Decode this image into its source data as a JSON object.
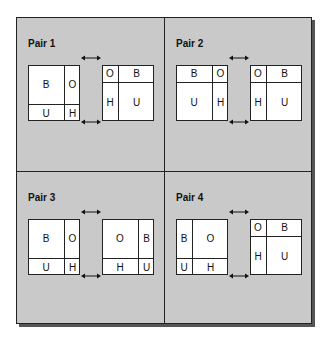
{
  "pairs": [
    {
      "label": "Pair 1",
      "left": {
        "layout": "tall-left-wide-top",
        "cells": [
          {
            "text": "B",
            "x": 0,
            "y": 0,
            "w": 36,
            "h": 39
          },
          {
            "text": "O",
            "x": 36,
            "y": 0,
            "w": 16,
            "h": 39
          },
          {
            "text": "U",
            "x": 0,
            "y": 39,
            "w": 36,
            "h": 17
          },
          {
            "text": "H",
            "x": 36,
            "y": 39,
            "w": 16,
            "h": 17
          }
        ]
      },
      "right": {
        "cells": [
          {
            "text": "O",
            "x": 0,
            "y": 0,
            "w": 16,
            "h": 17
          },
          {
            "text": "B",
            "x": 16,
            "y": 0,
            "w": 36,
            "h": 17
          },
          {
            "text": "H",
            "x": 0,
            "y": 17,
            "w": 16,
            "h": 39
          },
          {
            "text": "U",
            "x": 16,
            "y": 17,
            "w": 36,
            "h": 39
          }
        ]
      }
    },
    {
      "label": "Pair 2",
      "left": {
        "cells": [
          {
            "text": "B",
            "x": 0,
            "y": 0,
            "w": 36,
            "h": 17
          },
          {
            "text": "O",
            "x": 36,
            "y": 0,
            "w": 16,
            "h": 17
          },
          {
            "text": "U",
            "x": 0,
            "y": 17,
            "w": 36,
            "h": 39
          },
          {
            "text": "H",
            "x": 36,
            "y": 17,
            "w": 16,
            "h": 39
          }
        ]
      },
      "right": {
        "cells": [
          {
            "text": "O",
            "x": 0,
            "y": 0,
            "w": 16,
            "h": 17
          },
          {
            "text": "B",
            "x": 16,
            "y": 0,
            "w": 36,
            "h": 17
          },
          {
            "text": "H",
            "x": 0,
            "y": 17,
            "w": 16,
            "h": 39
          },
          {
            "text": "U",
            "x": 16,
            "y": 17,
            "w": 36,
            "h": 39
          }
        ]
      }
    },
    {
      "label": "Pair 3",
      "left": {
        "cells": [
          {
            "text": "B",
            "x": 0,
            "y": 0,
            "w": 36,
            "h": 39
          },
          {
            "text": "O",
            "x": 36,
            "y": 0,
            "w": 16,
            "h": 39
          },
          {
            "text": "U",
            "x": 0,
            "y": 39,
            "w": 36,
            "h": 17
          },
          {
            "text": "H",
            "x": 36,
            "y": 39,
            "w": 16,
            "h": 17
          }
        ]
      },
      "right": {
        "cells": [
          {
            "text": "O",
            "x": 0,
            "y": 0,
            "w": 36,
            "h": 39
          },
          {
            "text": "B",
            "x": 36,
            "y": 0,
            "w": 16,
            "h": 39
          },
          {
            "text": "H",
            "x": 0,
            "y": 39,
            "w": 36,
            "h": 17
          },
          {
            "text": "U",
            "x": 36,
            "y": 39,
            "w": 16,
            "h": 17
          }
        ]
      }
    },
    {
      "label": "Pair 4",
      "left": {
        "cells": [
          {
            "text": "B",
            "x": 0,
            "y": 0,
            "w": 16,
            "h": 39
          },
          {
            "text": "O",
            "x": 16,
            "y": 0,
            "w": 36,
            "h": 39
          },
          {
            "text": "U",
            "x": 0,
            "y": 39,
            "w": 16,
            "h": 17
          },
          {
            "text": "H",
            "x": 16,
            "y": 39,
            "w": 36,
            "h": 17
          }
        ]
      },
      "right": {
        "cells": [
          {
            "text": "O",
            "x": 0,
            "y": 0,
            "w": 16,
            "h": 17
          },
          {
            "text": "B",
            "x": 16,
            "y": 0,
            "w": 36,
            "h": 17
          },
          {
            "text": "H",
            "x": 0,
            "y": 17,
            "w": 16,
            "h": 39
          },
          {
            "text": "U",
            "x": 16,
            "y": 17,
            "w": 36,
            "h": 39
          }
        ]
      }
    }
  ]
}
